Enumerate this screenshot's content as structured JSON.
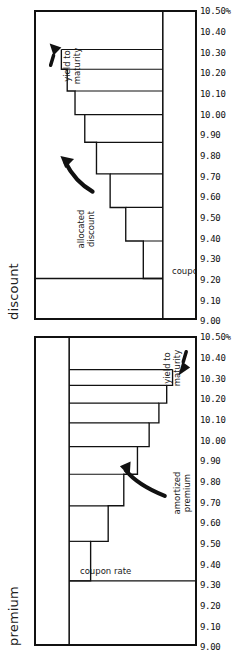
{
  "figure": {
    "orientation": "rotated-90-ccw",
    "background": "#ffffff",
    "ink": "#111111"
  },
  "panels": {
    "premium": {
      "title": "premium",
      "coupon_label": "coupon rate",
      "amortized_label": "amortized\npremium",
      "ytm_label": "yield to\nmaturity"
    },
    "discount": {
      "title": "discount",
      "coupon_label": "coupon rate",
      "allocated_label": "allocated\ndiscount",
      "ytm_label": "yield to\nmaturity"
    }
  },
  "axis": {
    "unit_suffix": "%",
    "tick_labels": [
      "10.50%",
      "10.40",
      "10.30",
      "10.20",
      "10.10",
      "10.00",
      "9.90",
      "9.80",
      "9.70",
      "9.60",
      "9.50",
      "9.40",
      "9.30",
      "9.20",
      "9.10",
      "9.00"
    ],
    "tick_values": [
      10.5,
      10.4,
      10.3,
      10.2,
      10.1,
      10.0,
      9.9,
      9.8,
      9.7,
      9.6,
      9.5,
      9.4,
      9.3,
      9.2,
      9.1,
      9.0
    ],
    "min": 9.0,
    "max": 10.5
  },
  "chart_data": [
    {
      "type": "line",
      "title": "premium",
      "xlabel": "",
      "ylabel": "",
      "ylim": [
        9.0,
        10.5
      ],
      "grid": false,
      "legend": "annotations",
      "categories": [
        "1",
        "2",
        "3",
        "4",
        "5",
        "6",
        "7",
        "8"
      ],
      "series": [
        {
          "name": "coupon rate",
          "style": "flat-line",
          "values": [
            9.8,
            9.8,
            9.8,
            9.8,
            9.8,
            9.8,
            9.8,
            9.8
          ]
        },
        {
          "name": "yield to maturity",
          "style": "step-down",
          "values": [
            9.74,
            9.68,
            9.62,
            9.56,
            9.5,
            9.46,
            9.42,
            9.4
          ]
        }
      ],
      "annotations": [
        {
          "text": "coupon rate",
          "points_to": "coupon rate line"
        },
        {
          "text": "amortized premium",
          "points_to": "gap between coupon rate and yield to maturity"
        },
        {
          "text": "yield to maturity",
          "points_to": "declining step line"
        }
      ]
    },
    {
      "type": "line",
      "title": "discount",
      "xlabel": "",
      "ylabel": "",
      "ylim": [
        9.0,
        10.5
      ],
      "grid": false,
      "legend": "annotations",
      "categories": [
        "1",
        "2",
        "3",
        "4",
        "5",
        "6",
        "7",
        "8"
      ],
      "series": [
        {
          "name": "coupon rate",
          "style": "flat-line",
          "values": [
            9.8,
            9.8,
            9.8,
            9.8,
            9.8,
            9.8,
            9.8,
            9.8
          ]
        },
        {
          "name": "yield to maturity",
          "style": "step-up",
          "values": [
            9.88,
            9.96,
            10.04,
            10.1,
            10.15,
            10.18,
            10.2,
            10.21
          ]
        }
      ],
      "annotations": [
        {
          "text": "allocated discount",
          "points_to": "gap between coupon rate and yield to maturity"
        },
        {
          "text": "yield to maturity",
          "points_to": "rising step line"
        },
        {
          "text": "coupon rate",
          "points_to": "coupon rate line"
        }
      ]
    }
  ]
}
